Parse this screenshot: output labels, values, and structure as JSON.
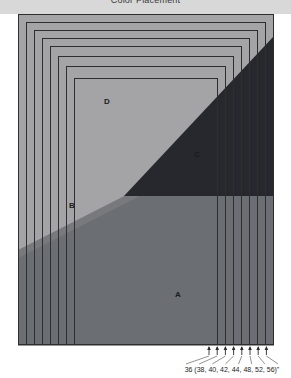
{
  "header": {
    "title": "Color Placement"
  },
  "figure": {
    "name": "nested-rectangles-color-placement",
    "regions": [
      {
        "id": "A",
        "label": "A",
        "color": "#6b6e73",
        "label_x": 178,
        "label_y": 297
      },
      {
        "id": "B",
        "label": "B",
        "color": "#78797c",
        "label_x": 72,
        "label_y": 208
      },
      {
        "id": "C",
        "label": "C",
        "color": "#26282e",
        "label_x": 197,
        "label_y": 157
      },
      {
        "id": "D",
        "label": "D",
        "color": "#a4a4a6",
        "label_x": 107,
        "label_y": 104
      }
    ],
    "outer_border_color": "#2e2e2e",
    "background_color": "#ffffff",
    "nested_rect_count": 8,
    "nested_rect_spacing_px": 8
  },
  "axis_annotation": {
    "text": "36 (38, 40, 42, 44, 48, 52, 56)\"",
    "base_value": "36",
    "values": [
      "36",
      "38",
      "40",
      "42",
      "44",
      "48",
      "52",
      "56"
    ],
    "unit": "\"",
    "tick_count": 8,
    "text_x": 232,
    "text_y": 372
  }
}
